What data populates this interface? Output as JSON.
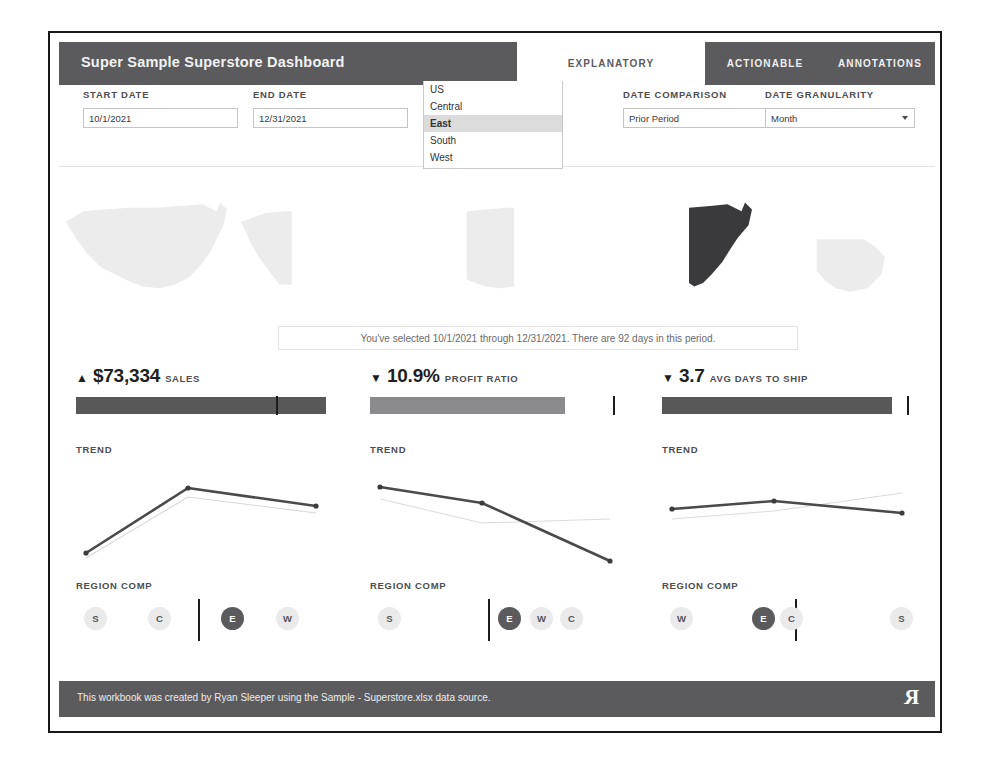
{
  "header": {
    "title": "Super Sample Superstore Dashboard",
    "tabs": [
      {
        "label": "EXPLANATORY",
        "active": true
      },
      {
        "label": "ACTIONABLE",
        "active": false
      },
      {
        "label": "ANNOTATIONS",
        "active": false
      }
    ]
  },
  "filters": {
    "start_date": {
      "label": "START DATE",
      "value": "10/1/2021"
    },
    "end_date": {
      "label": "END DATE",
      "value": "12/31/2021"
    },
    "region": {
      "label": "SELECT REGION",
      "value": "East",
      "options": [
        "US",
        "Central",
        "East",
        "South",
        "West"
      ],
      "selected_option": "East",
      "open": true
    },
    "date_comparison": {
      "label": "DATE COMPARISON",
      "value": "Prior Period"
    },
    "date_granularity": {
      "label": "DATE GRANULARITY",
      "value": "Month"
    }
  },
  "maps": [
    {
      "name": "US",
      "selected": false
    },
    {
      "name": "West",
      "selected": false
    },
    {
      "name": "Central",
      "selected": false
    },
    {
      "name": "East",
      "selected": true
    },
    {
      "name": "South",
      "selected": false
    }
  ],
  "selection_note": "You've selected 10/1/2021 through 12/31/2021. There are 92 days in this period.",
  "kpis": [
    {
      "id": "sales",
      "arrow": "▲",
      "direction": "up",
      "value": "$73,334",
      "name": "SALES",
      "bar_percent": 100,
      "bar_shade": "dark",
      "reference_percent": 80,
      "trend_label": "TREND",
      "regioncomp_label": "REGION COMP",
      "regions": [
        {
          "code": "S",
          "highlight": false
        },
        {
          "code": "C",
          "highlight": false
        },
        {
          "code": "E",
          "highlight": true
        },
        {
          "code": "W",
          "highlight": false
        }
      ]
    },
    {
      "id": "profit_ratio",
      "arrow": "▼",
      "direction": "down",
      "value": "10.9%",
      "name": "PROFIT RATIO",
      "bar_percent": 78,
      "bar_shade": "light",
      "reference_percent": 97,
      "trend_label": "TREND",
      "regioncomp_label": "REGION COMP",
      "regions": [
        {
          "code": "S",
          "highlight": false
        },
        {
          "code": "E",
          "highlight": true
        },
        {
          "code": "W",
          "highlight": false
        },
        {
          "code": "C",
          "highlight": false
        }
      ]
    },
    {
      "id": "avg_days_to_ship",
      "arrow": "▼",
      "direction": "down",
      "value": "3.7",
      "name": "AVG DAYS TO SHIP",
      "bar_percent": 92,
      "bar_shade": "dark",
      "reference_percent": 98,
      "trend_label": "TREND",
      "regioncomp_label": "REGION COMP",
      "regions": [
        {
          "code": "W",
          "highlight": false
        },
        {
          "code": "E",
          "highlight": true
        },
        {
          "code": "C",
          "highlight": false
        },
        {
          "code": "S",
          "highlight": false
        }
      ]
    }
  ],
  "chart_data": [
    {
      "type": "line",
      "title": "TREND",
      "metric": "Sales",
      "categories": [
        "Oct",
        "Nov",
        "Dec"
      ],
      "series": [
        {
          "name": "Current Period",
          "values": [
            36000,
            92000,
            83000
          ]
        },
        {
          "name": "Prior Period",
          "values": [
            26000,
            22000,
            88000
          ]
        }
      ],
      "ylabel": "Sales",
      "xlabel": "Month",
      "grid": false,
      "legend": "none"
    },
    {
      "type": "line",
      "title": "TREND",
      "metric": "Profit Ratio",
      "categories": [
        "Oct",
        "Nov",
        "Dec"
      ],
      "series": [
        {
          "name": "Current Period",
          "values": [
            15.8,
            13.5,
            2.0
          ]
        },
        {
          "name": "Prior Period",
          "values": [
            13.0,
            9.4,
            8.6
          ]
        }
      ],
      "ylabel": "Profit Ratio (%)",
      "xlabel": "Month",
      "grid": false,
      "legend": "none"
    },
    {
      "type": "line",
      "title": "TREND",
      "metric": "Avg Days to Ship",
      "categories": [
        "Oct",
        "Nov",
        "Dec"
      ],
      "series": [
        {
          "name": "Current Period",
          "values": [
            3.9,
            4.1,
            3.6
          ]
        },
        {
          "name": "Prior Period",
          "values": [
            3.5,
            4.0,
            4.4
          ]
        }
      ],
      "ylabel": "Days",
      "xlabel": "Month",
      "grid": false,
      "legend": "none"
    }
  ],
  "footer": {
    "text": "This workbook was created by Ryan Sleeper using the Sample - Superstore.xlsx data source.",
    "logo": "R"
  }
}
